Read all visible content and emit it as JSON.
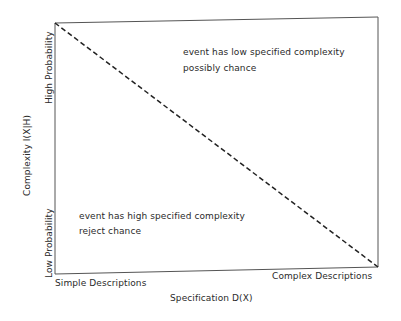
{
  "diagram": {
    "type": "specified-complexity-plot",
    "x_axis": {
      "title": "Specification D(X)",
      "left_label": "Simple Descriptions",
      "right_label": "Complex Descriptions"
    },
    "y_axis": {
      "title": "Complexity I(X|H)",
      "top_label": "High Probability",
      "bottom_label": "Low Probability"
    },
    "annotations": {
      "upper_right": {
        "line1": "event has low specified complexity",
        "line2": "possibly chance"
      },
      "lower_left": {
        "line1": "event has high specified complexity",
        "line2": "reject chance"
      }
    },
    "divider": "dashed diagonal from top-left to bottom-right",
    "colors": {
      "line": "#333333",
      "frame": "#555555",
      "text": "#2a2a2a",
      "background": "#ffffff"
    }
  }
}
